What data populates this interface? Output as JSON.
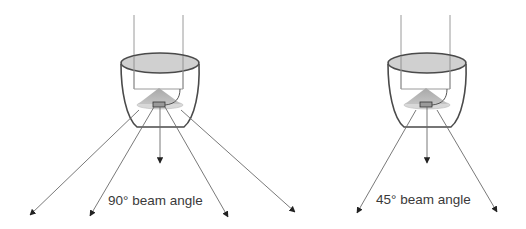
{
  "figures": [
    {
      "id": "left",
      "label": "90° beam angle",
      "beam_angle_deg": 90,
      "ray_count": 5
    },
    {
      "id": "right",
      "label": "45° beam angle",
      "beam_angle_deg": 45,
      "ray_count": 3
    }
  ],
  "colors": {
    "outline": "#4a4a4a",
    "rod": "#9a9a9a",
    "rim_fill": "#c8c8c8",
    "cone_fill": "#b0b0b0",
    "disc_fill": "#d8d8d8",
    "ray": "#6a6a6a",
    "text": "#3a3a3a"
  }
}
